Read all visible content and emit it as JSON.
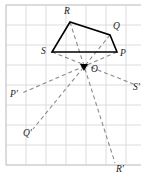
{
  "figure": {
    "center_label": "O",
    "colors": {
      "grid": "#d8d8dc",
      "border": "#c9c9cf",
      "shape_stroke": "#000000",
      "dashed_stroke": "#8a8a90",
      "label_color": "#1a1a1a",
      "background": "#ffffff"
    },
    "grid": {
      "spacing": 20,
      "x_start": 6,
      "y_start": 5,
      "columns": 7,
      "rows": 8,
      "visible": true
    },
    "shape": {
      "name": "quadrilateral-SRQP",
      "closed": true,
      "vertices": [
        {
          "label": "S",
          "x": 52,
          "y": 52,
          "label_x": 41,
          "label_y": 54
        },
        {
          "label": "R",
          "x": 70,
          "y": 22,
          "label_x": 64,
          "label_y": 14
        },
        {
          "label": "Q",
          "x": 110,
          "y": 35,
          "label_x": 113,
          "label_y": 29
        },
        {
          "label": "P",
          "x": 117,
          "y": 52,
          "label_x": 120,
          "label_y": 56
        }
      ]
    },
    "center_point": {
      "label": "O",
      "x": 84,
      "y": 67,
      "label_x": 91,
      "label_y": 72
    },
    "image_points": [
      {
        "label": "P'",
        "x": 22,
        "y": 93,
        "label_x": 10,
        "label_y": 97
      },
      {
        "label": "Q'",
        "x": 33,
        "y": 129,
        "label_x": 23,
        "label_y": 136
      },
      {
        "label": "R'",
        "x": 115,
        "y": 163,
        "label_x": 116,
        "label_y": 172
      },
      {
        "label": "S'",
        "x": 136,
        "y": 85,
        "label_x": 133,
        "label_y": 90
      }
    ],
    "rays": [
      {
        "name": "ray-S-to-Sprime",
        "from": "S",
        "x1": 52,
        "y1": 52,
        "x2": 136,
        "y2": 85
      },
      {
        "name": "ray-R-to-Rprime",
        "from": "R",
        "x1": 70,
        "y1": 22,
        "x2": 115,
        "y2": 163
      },
      {
        "name": "ray-Q-to-Qprime",
        "from": "Q",
        "x1": 110,
        "y1": 35,
        "x2": 33,
        "y2": 129
      },
      {
        "name": "ray-P-to-Pprime",
        "from": "P",
        "x1": 117,
        "y1": 52,
        "x2": 22,
        "y2": 93
      }
    ]
  }
}
